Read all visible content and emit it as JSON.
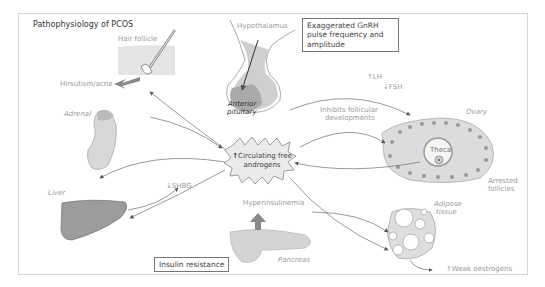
{
  "title": "Pathophysiology of PCOS",
  "boxes": {
    "gnrh": "Exaggerated GnRH pulse frequency and amplitude",
    "insulin": "Insulin resistance"
  },
  "center": {
    "arrow": "↑",
    "line1": "Circulating free",
    "line2": "androgens"
  },
  "labels": {
    "hair_follicle": "Hair follicle",
    "hirsutism": "Hirsutism/acne",
    "hypothalamus": "Hypothalamus",
    "anterior_pituitary_1": "Anterior",
    "anterior_pituitary_2": "pituitary",
    "adrenal": "Adrenal",
    "liver": "Liver",
    "shbg": "↓SHBG",
    "hyperinsulinemia": "Hyperinsulinemia",
    "pancreas": "Pancreas",
    "lh": "↑LH",
    "fsh": "↓FSH",
    "inhibit_1": "Inhibits follicular",
    "inhibit_2": "developments",
    "ovary": "Ovary",
    "theca": "Theca",
    "arrested_1": "Arrested",
    "arrested_2": "follicles",
    "adipose_1": "Adipose",
    "adipose_2": "tissue",
    "weak_oestrogens": "↑Weak oestrogens"
  },
  "colors": {
    "organ_fill": "#d9d9d9",
    "organ_dark": "#9a9a9a",
    "line": "#6e6e6e",
    "text_light": "#999999",
    "frame": "#d4d4d4"
  }
}
